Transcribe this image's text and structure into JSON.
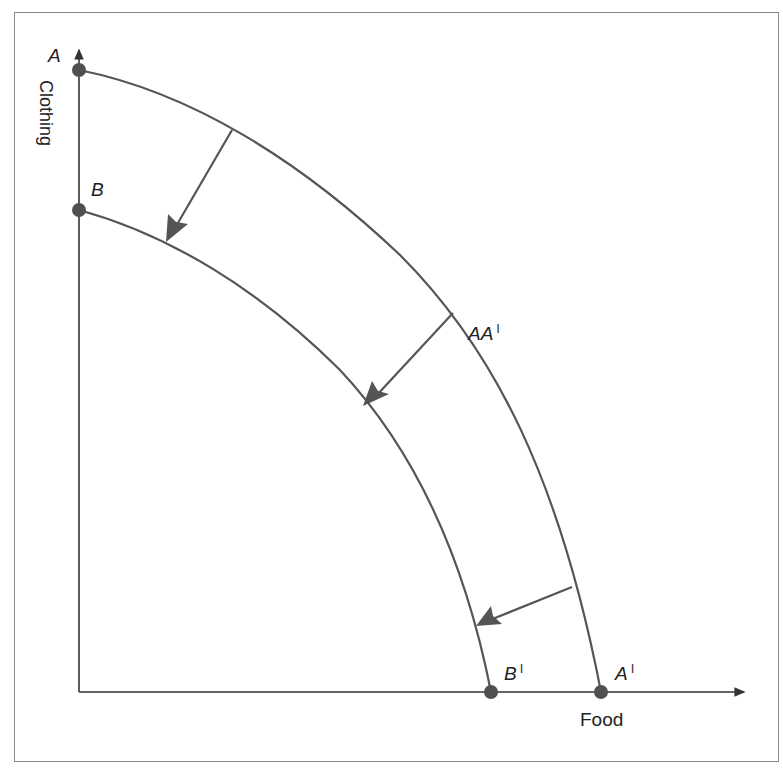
{
  "diagram": {
    "type": "production-possibility-frontier-shift",
    "axes": {
      "x_label": "Food",
      "y_label": "Clothing"
    },
    "curves": [
      {
        "name": "AA'",
        "label": "AA",
        "prime": "I",
        "start_label": "A",
        "end_label": "A",
        "end_prime": "I",
        "role": "original frontier"
      },
      {
        "name": "BB'",
        "start_label": "B",
        "end_label": "B",
        "end_prime": "I",
        "role": "shifted inward frontier"
      }
    ],
    "arrows": {
      "count": 3,
      "direction": "inward shift from AA' to BB'"
    },
    "colors": {
      "curve": "#555555",
      "axis": "#333333",
      "point": "#505050",
      "frame": "#8a8a8a"
    }
  }
}
